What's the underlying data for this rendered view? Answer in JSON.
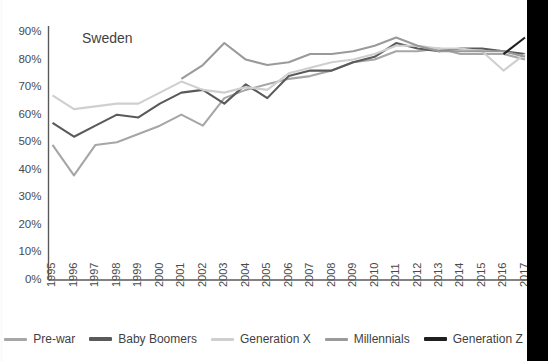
{
  "chart_data": {
    "type": "line",
    "title": "Sweden",
    "xlabel": "",
    "ylabel": "",
    "ylim": [
      0,
      0.9
    ],
    "ytick_labels": [
      "0%",
      "10%",
      "20%",
      "30%",
      "40%",
      "50%",
      "60%",
      "70%",
      "80%",
      "90%"
    ],
    "ytick_values": [
      0,
      10,
      20,
      30,
      40,
      50,
      60,
      70,
      80,
      90
    ],
    "grid": false,
    "legend_position": "bottom",
    "categories": [
      "1995",
      "1996",
      "1997",
      "1998",
      "1999",
      "2000",
      "2001",
      "2002",
      "2003",
      "2004",
      "2005",
      "2006",
      "2007",
      "2008",
      "2009",
      "2010",
      "2011",
      "2012",
      "2013",
      "2014",
      "2015",
      "2016",
      "2017"
    ],
    "series": [
      {
        "name": "Pre-war",
        "color": "#a6a6a6",
        "values": [
          49,
          38,
          49,
          50,
          53,
          56,
          60,
          56,
          66,
          69,
          71,
          73,
          74,
          76,
          79,
          80,
          83,
          83,
          84,
          82,
          82,
          82,
          80
        ]
      },
      {
        "name": "Baby Boomers",
        "color": "#5a5a5a",
        "values": [
          57,
          52,
          56,
          60,
          59,
          64,
          68,
          69,
          64,
          71,
          66,
          74,
          76,
          76,
          79,
          81,
          86,
          84,
          83,
          84,
          84,
          83,
          82
        ]
      },
      {
        "name": "Generation X",
        "color": "#cfcfcf",
        "values": [
          67,
          62,
          63,
          64,
          64,
          68,
          72,
          69,
          68,
          70,
          69,
          75,
          77,
          79,
          80,
          82,
          85,
          85,
          84,
          84,
          83,
          76,
          82
        ]
      },
      {
        "name": "Millennials",
        "color": "#9a9a9a",
        "values": [
          null,
          null,
          null,
          null,
          null,
          null,
          73,
          78,
          86,
          80,
          78,
          79,
          82,
          82,
          83,
          85,
          88,
          85,
          83,
          83,
          83,
          83,
          81
        ]
      },
      {
        "name": "Generation Z",
        "color": "#1f1f1f",
        "values": [
          null,
          null,
          null,
          null,
          null,
          null,
          null,
          null,
          null,
          null,
          null,
          null,
          null,
          null,
          null,
          null,
          null,
          null,
          null,
          null,
          null,
          82,
          88
        ]
      }
    ]
  },
  "legend": {
    "items": [
      {
        "label": "Pre-war"
      },
      {
        "label": "Baby Boomers"
      },
      {
        "label": "Generation X"
      },
      {
        "label": "Millennials"
      },
      {
        "label": "Generation Z"
      }
    ]
  }
}
